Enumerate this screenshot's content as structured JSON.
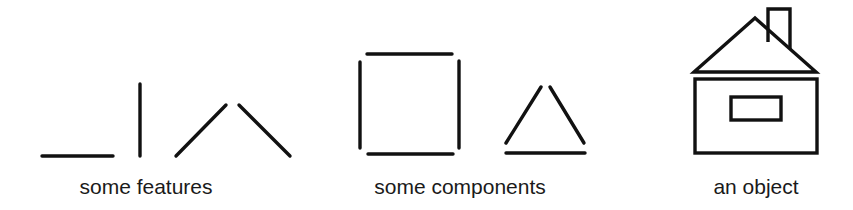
{
  "colors": {
    "background": "#ffffff",
    "ink": "#111111"
  },
  "panels": [
    {
      "id": "features",
      "label": "some features",
      "items": [
        "horizontal-line",
        "vertical-line",
        "diagonal-line-up",
        "diagonal-line-down"
      ]
    },
    {
      "id": "components",
      "label": "some components",
      "items": [
        "square-of-four-lines",
        "triangle-of-three-lines"
      ]
    },
    {
      "id": "object",
      "label": "an object",
      "items": [
        "house"
      ]
    }
  ]
}
